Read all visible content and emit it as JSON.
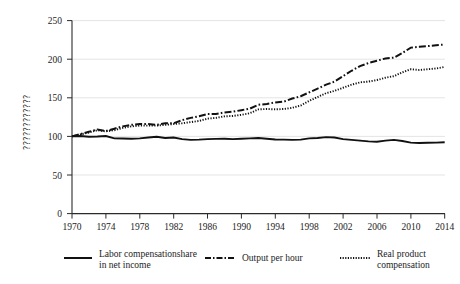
{
  "chart_data": {
    "type": "line",
    "title": "",
    "xlabel": "",
    "ylabel": "????????????",
    "ylim": [
      0,
      250
    ],
    "xlim": [
      1970,
      2014
    ],
    "grid": true,
    "legend_position": "bottom",
    "yticks": [
      0,
      50,
      100,
      150,
      200,
      250
    ],
    "xticks": [
      1970,
      1974,
      1978,
      1982,
      1986,
      1990,
      1994,
      1998,
      2002,
      2006,
      2010,
      2014
    ],
    "x": [
      1970,
      1971,
      1972,
      1973,
      1974,
      1975,
      1976,
      1977,
      1978,
      1979,
      1980,
      1981,
      1982,
      1983,
      1984,
      1985,
      1986,
      1987,
      1988,
      1989,
      1990,
      1991,
      1992,
      1993,
      1994,
      1995,
      1996,
      1997,
      1998,
      1999,
      2000,
      2001,
      2002,
      2003,
      2004,
      2005,
      2006,
      2007,
      2008,
      2009,
      2010,
      2011,
      2012,
      2013,
      2014
    ],
    "series": [
      {
        "name": "Labor compensationshare in net income",
        "style": "solid",
        "color": "#111111",
        "values": [
          100,
          100.5,
          99.5,
          99.8,
          100.5,
          97.5,
          97.2,
          97.0,
          97.5,
          98.5,
          99.5,
          98.0,
          98.5,
          96.5,
          95.5,
          95.8,
          96.5,
          96.8,
          97.0,
          96.5,
          97.0,
          97.5,
          98.0,
          97.0,
          96.0,
          95.8,
          95.5,
          95.8,
          97.5,
          98.0,
          99.0,
          98.5,
          96.5,
          95.5,
          94.5,
          93.5,
          93.0,
          94.5,
          95.5,
          94.0,
          92.0,
          91.5,
          91.8,
          92.0,
          92.5
        ]
      },
      {
        "name": "Output per hour",
        "style": "dash-dot",
        "color": "#111111",
        "values": [
          100,
          103,
          106,
          109,
          107,
          110,
          113,
          115,
          116,
          116,
          115,
          117,
          117,
          121,
          124,
          126,
          129,
          129,
          131,
          132,
          134,
          136,
          141,
          142,
          144,
          145,
          149,
          152,
          157,
          162,
          167,
          171,
          178,
          185,
          191,
          195,
          198,
          201,
          202,
          208,
          215,
          216,
          217,
          218,
          219
        ]
      },
      {
        "name": "Real product compensation",
        "style": "dotted",
        "color": "#111111",
        "values": [
          100,
          102.5,
          105,
          108,
          106.5,
          108,
          111,
          113,
          114,
          114,
          114,
          115,
          116,
          117,
          118.5,
          120,
          123,
          124,
          126,
          126.5,
          128,
          130,
          135,
          135.5,
          135,
          135.5,
          137,
          140,
          146,
          151,
          156,
          159,
          163,
          167,
          170,
          171,
          173,
          176,
          178,
          183,
          187,
          186,
          187,
          188,
          190
        ]
      }
    ]
  },
  "legend": {
    "entries": [
      {
        "label_line1": "Labor compensationshare",
        "label_line2": "in net income",
        "style": "solid"
      },
      {
        "label_line1": "Output per hour",
        "label_line2": "",
        "style": "dash-dot"
      },
      {
        "label_line1": "Real product",
        "label_line2": "compensation",
        "style": "dotted"
      }
    ]
  },
  "axis": {
    "y_title": "????????????"
  }
}
